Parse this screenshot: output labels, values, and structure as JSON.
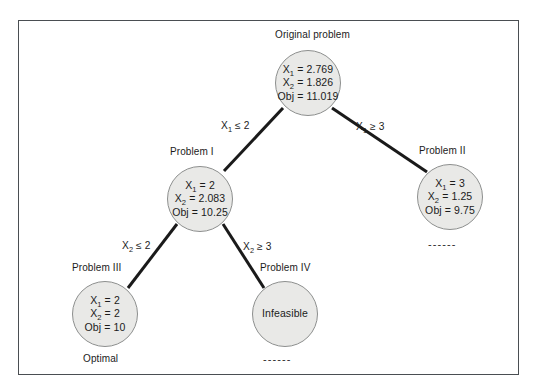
{
  "figure": {
    "type": "branch-and-bound-tree",
    "nodes": [
      {
        "id": "root",
        "caption": "Original problem",
        "lines": [
          "X1 = 2.769",
          "X2 = 1.826",
          "Obj = 11.019"
        ],
        "var1_label": "X",
        "var1_sub": "1",
        "var1_value": "2.769",
        "var2_label": "X",
        "var2_sub": "2",
        "var2_value": "1.826",
        "obj_label": "Obj",
        "obj_value": "11.019",
        "status": ""
      },
      {
        "id": "problem1",
        "caption": "Problem I",
        "lines": [
          "X1 = 2",
          "X2 = 2.083",
          "Obj = 10.25"
        ],
        "var1_label": "X",
        "var1_sub": "1",
        "var1_value": "2",
        "var2_label": "X",
        "var2_sub": "2",
        "var2_value": "2.083",
        "obj_label": "Obj",
        "obj_value": "10.25",
        "status": ""
      },
      {
        "id": "problem2",
        "caption": "Problem II",
        "lines": [
          "X1 = 3",
          "X2 = 1.25",
          "Obj = 9.75"
        ],
        "var1_label": "X",
        "var1_sub": "1",
        "var1_value": "3",
        "var2_label": "X",
        "var2_sub": "2",
        "var2_value": "1.25",
        "obj_label": "Obj",
        "obj_value": "9.75",
        "status": "------"
      },
      {
        "id": "problem3",
        "caption": "Problem III",
        "lines": [
          "X1 = 2",
          "X2 = 2",
          "Obj = 10"
        ],
        "var1_label": "X",
        "var1_sub": "1",
        "var1_value": "2",
        "var2_label": "X",
        "var2_sub": "2",
        "var2_value": "2",
        "obj_label": "Obj",
        "obj_value": "10",
        "status": "Optimal"
      },
      {
        "id": "problem4",
        "caption": "Problem IV",
        "lines": [
          "Infeasible"
        ],
        "body_text": "Infeasible",
        "status": "------"
      }
    ],
    "edges": [
      {
        "id": "root-to-problem1",
        "label_var": "X",
        "label_sub": "1",
        "label_rel": "≤ 2"
      },
      {
        "id": "root-to-problem2",
        "label_var": "X",
        "label_sub": "1",
        "label_rel": "≥ 3"
      },
      {
        "id": "problem1-to-problem3",
        "label_var": "X",
        "label_sub": "2",
        "label_rel": "≤ 2"
      },
      {
        "id": "problem1-to-problem4",
        "label_var": "X",
        "label_sub": "2",
        "label_rel": "≥ 3"
      }
    ],
    "colors": {
      "node_fill": "#e9e9e7",
      "node_stroke": "#8d8f8e",
      "edge_stroke": "#1a1a1a",
      "frame_stroke": "#4a4e52",
      "text": "#1b1b1b"
    }
  }
}
